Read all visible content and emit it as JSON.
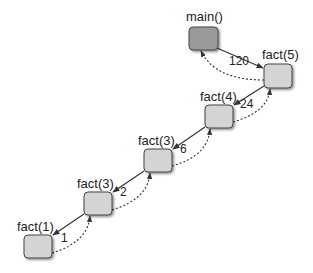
{
  "diagram": {
    "type": "recursion-call-stack",
    "colors": {
      "main_fill": "#9a9a9a",
      "frame_fill": "#d4d4d4",
      "stroke": "#444444",
      "call_arrow": "#333333",
      "return_arrow": "#333333"
    },
    "nodes": [
      {
        "id": "main",
        "label": "main()",
        "x": 189,
        "y": 27,
        "w": 29,
        "h": 23,
        "lx": 186,
        "ly": 10
      },
      {
        "id": "f5",
        "label": "fact(5)",
        "x": 264,
        "y": 64,
        "w": 28,
        "h": 24,
        "lx": 262,
        "ly": 48
      },
      {
        "id": "f4",
        "label": "fact(4)",
        "x": 205,
        "y": 105,
        "w": 28,
        "h": 23,
        "lx": 200,
        "ly": 90
      },
      {
        "id": "f3a",
        "label": "fact(3)",
        "x": 144,
        "y": 149,
        "w": 28,
        "h": 23,
        "lx": 138,
        "ly": 134
      },
      {
        "id": "f3b",
        "label": "fact(3)",
        "x": 84,
        "y": 192,
        "w": 28,
        "h": 23,
        "lx": 77,
        "ly": 177
      },
      {
        "id": "f1",
        "label": "fact(1)",
        "x": 24,
        "y": 235,
        "w": 28,
        "h": 23,
        "lx": 17,
        "ly": 220
      }
    ],
    "returns": [
      {
        "value": "120",
        "x": 229,
        "y": 55
      },
      {
        "value": "24",
        "x": 240,
        "y": 98
      },
      {
        "value": "6",
        "x": 180,
        "y": 143
      },
      {
        "value": "2",
        "x": 120,
        "y": 186
      },
      {
        "value": "1",
        "x": 61,
        "y": 232
      }
    ]
  }
}
